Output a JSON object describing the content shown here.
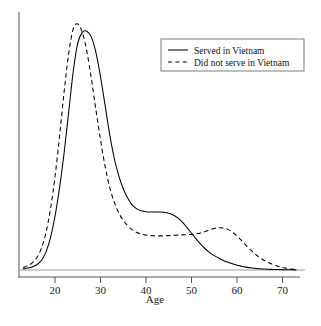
{
  "chart_data": {
    "type": "line",
    "title": "",
    "subtitle": "",
    "xlabel": "Age",
    "ylabel": "",
    "xlim": [
      13,
      73
    ],
    "ylim": [
      0,
      1.06
    ],
    "grid": false,
    "legend_position": "top-right",
    "xticks": [
      20,
      30,
      40,
      50,
      60,
      70
    ],
    "xtick_labels": [
      "20",
      "30",
      "40",
      "50",
      "60",
      "70"
    ],
    "yticks": [],
    "ytick_labels": [],
    "annotations": [],
    "note": "Kernel density estimates of age distribution, two groups; y-axis unlabeled (relative density).",
    "series": [
      {
        "name": "Served in Vietnam",
        "style": "solid",
        "color": "#000000",
        "peak_age": 27,
        "peak_value": 1.0,
        "x": [
          13,
          14,
          15,
          16,
          17,
          18,
          19,
          20,
          21,
          22,
          23,
          24,
          25,
          26,
          27,
          28,
          29,
          30,
          31,
          32,
          33,
          34,
          35,
          36,
          37,
          38,
          39,
          40,
          41,
          42,
          43,
          44,
          45,
          46,
          47,
          48,
          49,
          50,
          51,
          52,
          53,
          54,
          55,
          56,
          57,
          58,
          59,
          60,
          61,
          62,
          63,
          64,
          65,
          66,
          67,
          68,
          69,
          70,
          71,
          72,
          73
        ],
        "values": [
          0.005,
          0.008,
          0.013,
          0.022,
          0.04,
          0.075,
          0.135,
          0.225,
          0.345,
          0.49,
          0.66,
          0.83,
          0.95,
          0.995,
          1.0,
          0.975,
          0.91,
          0.81,
          0.69,
          0.57,
          0.47,
          0.395,
          0.34,
          0.3,
          0.272,
          0.256,
          0.248,
          0.244,
          0.243,
          0.243,
          0.243,
          0.242,
          0.238,
          0.23,
          0.218,
          0.2,
          0.178,
          0.154,
          0.13,
          0.108,
          0.089,
          0.073,
          0.06,
          0.049,
          0.04,
          0.032,
          0.026,
          0.02,
          0.016,
          0.012,
          0.009,
          0.007,
          0.005,
          0.004,
          0.003,
          0.002,
          0.002,
          0.001,
          0.001,
          0.001,
          0.0
        ]
      },
      {
        "name": "Did not serve in Vietnam",
        "style": "dashed",
        "color": "#000000",
        "peak_age": 25,
        "peak_value": 1.03,
        "x": [
          13,
          14,
          15,
          16,
          17,
          18,
          19,
          20,
          21,
          22,
          23,
          24,
          25,
          26,
          27,
          28,
          29,
          30,
          31,
          32,
          33,
          34,
          35,
          36,
          37,
          38,
          39,
          40,
          41,
          42,
          43,
          44,
          45,
          46,
          47,
          48,
          49,
          50,
          51,
          52,
          53,
          54,
          55,
          56,
          57,
          58,
          59,
          60,
          61,
          62,
          63,
          64,
          65,
          66,
          67,
          68,
          69,
          70,
          71,
          72,
          73
        ],
        "values": [
          0.01,
          0.018,
          0.03,
          0.052,
          0.09,
          0.155,
          0.255,
          0.39,
          0.56,
          0.745,
          0.905,
          1.01,
          1.03,
          0.995,
          0.915,
          0.8,
          0.67,
          0.545,
          0.435,
          0.348,
          0.285,
          0.24,
          0.208,
          0.185,
          0.168,
          0.157,
          0.15,
          0.146,
          0.144,
          0.143,
          0.143,
          0.143,
          0.144,
          0.145,
          0.146,
          0.147,
          0.148,
          0.149,
          0.151,
          0.155,
          0.161,
          0.168,
          0.174,
          0.177,
          0.176,
          0.17,
          0.158,
          0.142,
          0.123,
          0.103,
          0.084,
          0.067,
          0.052,
          0.04,
          0.03,
          0.022,
          0.016,
          0.011,
          0.007,
          0.004,
          0.002
        ]
      }
    ],
    "legend": [
      {
        "label": "Served in Vietnam",
        "style": "solid"
      },
      {
        "label": "Did not serve in Vietnam",
        "style": "dashed"
      }
    ]
  }
}
